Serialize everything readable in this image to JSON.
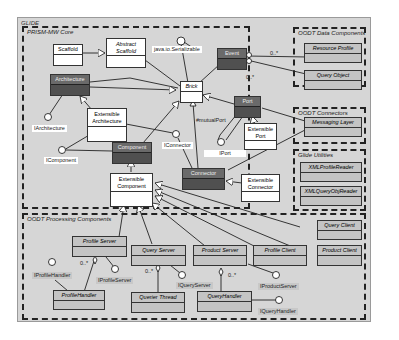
{
  "diagram": {
    "title": "GLIDE",
    "colors": {
      "background": "#d6d6d6",
      "dark_class": "#5d5d5d",
      "white_class": "#ffffff",
      "grey_class": "#c4c4c4",
      "border": "#222222"
    },
    "packages": {
      "core": {
        "label": "PRISM-MW Core"
      },
      "data": {
        "label": "OODT Data Components"
      },
      "connectors": {
        "label": "OODT Connectors"
      },
      "utilities": {
        "label": "Glide Utilities"
      },
      "processing": {
        "label": "OODT Processing Components"
      }
    },
    "classes": {
      "scaffold": "Scaffold",
      "abstract_scaffold_1": "Abstract",
      "abstract_scaffold_2": "Scaffold",
      "architecture": "Architecture",
      "ext_architecture_1": "Extensible",
      "ext_architecture_2": "Architecture",
      "brick": "Brick",
      "event": "Event",
      "port": "Port",
      "ext_port_1": "Extensible",
      "ext_port_2": "Port",
      "component": "Component",
      "ext_component_1": "Extensible",
      "ext_component_2": "Component",
      "connector": "Connector",
      "ext_connector_1": "Extensible",
      "ext_connector_2": "Connector",
      "resource_profile": "Resource Profile",
      "query_object": "Query Object",
      "messaging_layer": "Messaging Layer",
      "xml_profile_reader": "XMLProfileReader",
      "xml_query_obj_reader": "XMLQueryObjReader",
      "profile_server": "Profile Server",
      "query_server": "Query Server",
      "product_server": "Product Server",
      "profile_client": "Profile Client",
      "product_client": "Product Client",
      "query_client": "Query Client",
      "profile_handler": "ProfileHandler",
      "querier_thread": "Querier Thread",
      "query_handler": "QueryHandler"
    },
    "interfaces": {
      "serializable": "java.io.Serializable",
      "iarchitecture": "IArchitecture",
      "icomponent": "IComponent",
      "iconnector": "IConnector",
      "iport": "IPort",
      "mutual_port": "#mutualPort",
      "iprofile_handler": "IProfileHandler",
      "iprofile_server": "IProfileServer",
      "iquery_server": "IQueryServer",
      "iproduct_server": "IProductServer",
      "iquery_handler": "IQueryHandler"
    },
    "multiplicities": {
      "event_resource": "0..*",
      "event_query": "0..*",
      "profile_handler": "0..*",
      "querier_thread": "0..*",
      "query_handler": "0..*"
    }
  }
}
